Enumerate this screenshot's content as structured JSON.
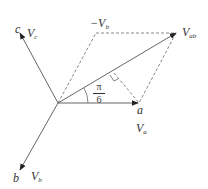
{
  "diagram": {
    "colors": {
      "line": "#666666",
      "dashed": "#888888",
      "text": "#333333"
    },
    "origin": [
      58,
      103
    ],
    "vectors": [
      {
        "id": "Va",
        "end": [
          138,
          103
        ],
        "style": "solid"
      },
      {
        "id": "Vb",
        "end": [
          20,
          170
        ],
        "style": "solid"
      },
      {
        "id": "Vc",
        "end": [
          20,
          33
        ],
        "style": "solid"
      },
      {
        "id": "Vab",
        "end": [
          176,
          33
        ],
        "style": "solid"
      },
      {
        "id": "-Vb",
        "end": [
          96,
          33
        ],
        "style": "dashed"
      }
    ],
    "labels": {
      "c": "c",
      "Vc": "V",
      "Vc_sub": "c",
      "neg_Vb": "−V",
      "neg_Vb_sub": "b",
      "Vab": "V",
      "Vab_sub": "ab",
      "a": "a",
      "Va": "V",
      "Va_sub": "a",
      "b": "b",
      "Vb": "V",
      "Vb_sub": "b",
      "angle_num": "π",
      "angle_den": "6"
    }
  }
}
